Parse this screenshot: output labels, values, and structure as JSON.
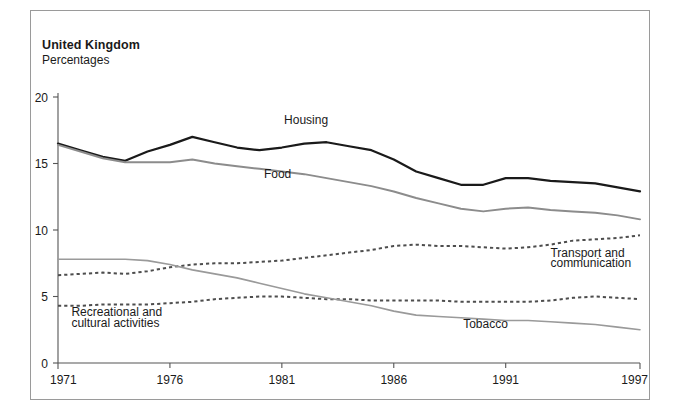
{
  "header": {
    "title": "United Kingdom",
    "subtitle": "Percentages"
  },
  "chart_data": {
    "type": "line",
    "title": "United Kingdom",
    "subtitle": "Percentages",
    "xlabel": "",
    "ylabel": "Percentages",
    "xlim": [
      1971,
      1997
    ],
    "ylim": [
      0,
      20
    ],
    "yticks": [
      0,
      5,
      10,
      15,
      20
    ],
    "xticks": [
      1971,
      1976,
      1981,
      1986,
      1991,
      1997
    ],
    "grid": false,
    "legend_position": "inline-annotations",
    "x": [
      1971,
      1972,
      1973,
      1974,
      1975,
      1976,
      1977,
      1978,
      1979,
      1980,
      1981,
      1982,
      1983,
      1984,
      1985,
      1986,
      1987,
      1988,
      1989,
      1990,
      1991,
      1992,
      1993,
      1994,
      1995,
      1996,
      1997
    ],
    "series": [
      {
        "name": "Housing",
        "style": "solid",
        "color": "#1a1a1a",
        "width": 2.2,
        "values": [
          16.5,
          16.0,
          15.5,
          15.2,
          15.9,
          16.4,
          17.0,
          16.6,
          16.2,
          16.0,
          16.2,
          16.5,
          16.6,
          16.3,
          16.0,
          15.3,
          14.4,
          13.9,
          13.4,
          13.4,
          13.9,
          13.9,
          13.7,
          13.6,
          13.5,
          13.2,
          12.9
        ]
      },
      {
        "name": "Food",
        "style": "solid",
        "color": "#8c8c8c",
        "width": 2.0,
        "values": [
          16.4,
          15.9,
          15.4,
          15.1,
          15.1,
          15.1,
          15.3,
          15.0,
          14.8,
          14.6,
          14.4,
          14.2,
          13.9,
          13.6,
          13.3,
          12.9,
          12.4,
          12.0,
          11.6,
          11.4,
          11.6,
          11.7,
          11.5,
          11.4,
          11.3,
          11.1,
          10.8
        ]
      },
      {
        "name": "Transport and communication",
        "style": "dotted",
        "color": "#4d4d4d",
        "width": 2.0,
        "values": [
          6.6,
          6.7,
          6.8,
          6.7,
          6.9,
          7.2,
          7.4,
          7.5,
          7.5,
          7.6,
          7.7,
          7.9,
          8.1,
          8.3,
          8.5,
          8.8,
          8.9,
          8.8,
          8.8,
          8.7,
          8.6,
          8.7,
          8.9,
          9.2,
          9.3,
          9.4,
          9.6
        ]
      },
      {
        "name": "Recreational and cultural activities",
        "style": "dotted",
        "color": "#4d4d4d",
        "width": 2.0,
        "values": [
          4.3,
          4.3,
          4.4,
          4.4,
          4.4,
          4.5,
          4.6,
          4.8,
          4.9,
          5.0,
          5.0,
          4.9,
          4.8,
          4.8,
          4.7,
          4.7,
          4.7,
          4.7,
          4.6,
          4.6,
          4.6,
          4.6,
          4.7,
          4.9,
          5.0,
          4.9,
          4.8
        ]
      },
      {
        "name": "Tobacco",
        "style": "solid",
        "color": "#9a9a9a",
        "width": 1.6,
        "values": [
          7.8,
          7.8,
          7.8,
          7.8,
          7.7,
          7.4,
          7.0,
          6.7,
          6.4,
          6.0,
          5.6,
          5.2,
          4.9,
          4.6,
          4.3,
          3.9,
          3.6,
          3.5,
          3.4,
          3.3,
          3.2,
          3.2,
          3.1,
          3.0,
          2.9,
          2.7,
          2.5
        ]
      }
    ],
    "annotations": [
      {
        "text": "Housing",
        "x": 1981.1,
        "y": 18.0
      },
      {
        "text": "Food",
        "x": 1980.2,
        "y": 13.9
      },
      {
        "text": "Transport and",
        "x": 1993.0,
        "y": 8.0
      },
      {
        "text": "communication",
        "x": 1993.0,
        "y": 7.2
      },
      {
        "text": "Recreational and",
        "x": 1971.6,
        "y": 3.5
      },
      {
        "text": "cultural activities",
        "x": 1971.6,
        "y": 2.7
      },
      {
        "text": "Tobacco",
        "x": 1989.1,
        "y": 2.6
      }
    ]
  },
  "axis": {
    "y_labels": [
      "20",
      "15",
      "10",
      "5",
      "0"
    ],
    "x_labels": [
      "1971",
      "1976",
      "1981",
      "1986",
      "1991",
      "1997"
    ]
  }
}
